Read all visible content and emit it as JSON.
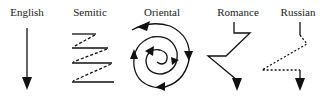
{
  "diagram": {
    "ink_color": "#111111",
    "panels": [
      {
        "id": "english",
        "label": "English",
        "label_x": 27,
        "pattern": "straight-down-arrow"
      },
      {
        "id": "semitic",
        "label": "Semitic",
        "label_x": 90,
        "pattern": "parallel-zigzag"
      },
      {
        "id": "oriental",
        "label": "Oriental",
        "label_x": 162,
        "pattern": "inward-spiral"
      },
      {
        "id": "romance",
        "label": "Romance",
        "label_x": 238,
        "pattern": "digressive-zigzag"
      },
      {
        "id": "russian",
        "label": "Russian",
        "label_x": 298,
        "pattern": "dotted-digression"
      }
    ]
  }
}
